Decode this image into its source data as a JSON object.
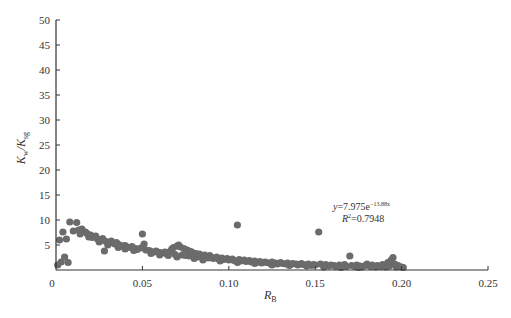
{
  "chart_data": {
    "type": "scatter",
    "title": "",
    "xlabel": "R_B",
    "xlabel_main": "R",
    "xlabel_sub": "B",
    "ylabel": "K_w/K_sg",
    "ylabel_main1": "K",
    "ylabel_sub1": "w",
    "ylabel_sep": "/K",
    "ylabel_sub2": "sg",
    "xlim": [
      0,
      0.25
    ],
    "ylim": [
      0,
      50
    ],
    "xticks": [
      0,
      0.05,
      0.1,
      0.15,
      0.2,
      0.25
    ],
    "xtick_labels": [
      "0",
      "0.05",
      "0.10",
      "0.15",
      "0.20",
      "0.25"
    ],
    "yticks": [
      5,
      10,
      15,
      20,
      25,
      30,
      35,
      40,
      45,
      50
    ],
    "ytick_labels": [
      "5",
      "10",
      "15",
      "20",
      "25",
      "30",
      "35",
      "40",
      "45",
      "50"
    ],
    "grid": false,
    "legend": null,
    "marker_color": "#6b6b6b",
    "annotation": {
      "equation_prefix": "y=7.975e",
      "equation_exponent": "−13.88x",
      "r2_prefix": "R",
      "r2_sup": "2",
      "r2_value": "=0.7948",
      "x": 0.152,
      "y": 12.2
    },
    "fit": {
      "type": "exponential",
      "a": 7.975,
      "b": -13.88,
      "r2": 0.7948
    },
    "points": [
      [
        0.001,
        1.0
      ],
      [
        0.003,
        1.6
      ],
      [
        0.005,
        2.6
      ],
      [
        0.007,
        1.5
      ],
      [
        0.002,
        6.0
      ],
      [
        0.004,
        7.6
      ],
      [
        0.006,
        6.2
      ],
      [
        0.008,
        9.6
      ],
      [
        0.012,
        9.5
      ],
      [
        0.01,
        7.8
      ],
      [
        0.013,
        8.0
      ],
      [
        0.015,
        8.2
      ],
      [
        0.017,
        7.6
      ],
      [
        0.018,
        7.3
      ],
      [
        0.02,
        7.0
      ],
      [
        0.021,
        6.5
      ],
      [
        0.023,
        6.8
      ],
      [
        0.024,
        6.2
      ],
      [
        0.026,
        5.9
      ],
      [
        0.027,
        6.3
      ],
      [
        0.028,
        3.8
      ],
      [
        0.029,
        5.7
      ],
      [
        0.031,
        5.4
      ],
      [
        0.032,
        5.8
      ],
      [
        0.034,
        5.2
      ],
      [
        0.035,
        5.5
      ],
      [
        0.037,
        5.0
      ],
      [
        0.038,
        4.8
      ],
      [
        0.04,
        4.9
      ],
      [
        0.041,
        4.6
      ],
      [
        0.043,
        4.5
      ],
      [
        0.044,
        4.7
      ],
      [
        0.046,
        4.3
      ],
      [
        0.047,
        4.1
      ],
      [
        0.049,
        4.4
      ],
      [
        0.05,
        7.2
      ],
      [
        0.051,
        5.2
      ],
      [
        0.052,
        4.0
      ],
      [
        0.054,
        3.9
      ],
      [
        0.055,
        3.7
      ],
      [
        0.057,
        3.6
      ],
      [
        0.058,
        3.8
      ],
      [
        0.06,
        3.5
      ],
      [
        0.061,
        3.4
      ],
      [
        0.063,
        3.6
      ],
      [
        0.064,
        3.2
      ],
      [
        0.066,
        3.7
      ],
      [
        0.067,
        4.2
      ],
      [
        0.068,
        4.5
      ],
      [
        0.069,
        3.1
      ],
      [
        0.07,
        4.8
      ],
      [
        0.071,
        5.0
      ],
      [
        0.072,
        4.6
      ],
      [
        0.073,
        3.0
      ],
      [
        0.074,
        4.3
      ],
      [
        0.075,
        2.9
      ],
      [
        0.076,
        4.0
      ],
      [
        0.077,
        2.8
      ],
      [
        0.078,
        3.7
      ],
      [
        0.079,
        3.5
      ],
      [
        0.08,
        2.7
      ],
      [
        0.081,
        3.3
      ],
      [
        0.082,
        2.6
      ],
      [
        0.083,
        3.2
      ],
      [
        0.084,
        2.8
      ],
      [
        0.085,
        2.5
      ],
      [
        0.086,
        3.0
      ],
      [
        0.087,
        2.6
      ],
      [
        0.088,
        2.4
      ],
      [
        0.089,
        2.9
      ],
      [
        0.09,
        2.5
      ],
      [
        0.091,
        2.3
      ],
      [
        0.093,
        2.6
      ],
      [
        0.094,
        2.2
      ],
      [
        0.096,
        2.4
      ],
      [
        0.097,
        2.1
      ],
      [
        0.099,
        2.3
      ],
      [
        0.1,
        2.0
      ],
      [
        0.102,
        2.2
      ],
      [
        0.103,
        1.9
      ],
      [
        0.105,
        9.0
      ],
      [
        0.106,
        2.1
      ],
      [
        0.107,
        1.8
      ],
      [
        0.109,
        2.0
      ],
      [
        0.11,
        1.7
      ],
      [
        0.112,
        1.9
      ],
      [
        0.113,
        1.6
      ],
      [
        0.115,
        1.8
      ],
      [
        0.116,
        1.5
      ],
      [
        0.118,
        1.7
      ],
      [
        0.119,
        1.4
      ],
      [
        0.121,
        1.6
      ],
      [
        0.122,
        1.5
      ],
      [
        0.124,
        1.3
      ],
      [
        0.125,
        1.6
      ],
      [
        0.127,
        1.4
      ],
      [
        0.128,
        1.2
      ],
      [
        0.13,
        1.5
      ],
      [
        0.131,
        1.3
      ],
      [
        0.133,
        1.2
      ],
      [
        0.134,
        1.4
      ],
      [
        0.136,
        1.1
      ],
      [
        0.137,
        1.3
      ],
      [
        0.139,
        1.2
      ],
      [
        0.14,
        1.0
      ],
      [
        0.142,
        1.3
      ],
      [
        0.143,
        1.1
      ],
      [
        0.145,
        1.0
      ],
      [
        0.146,
        1.2
      ],
      [
        0.148,
        0.9
      ],
      [
        0.149,
        1.1
      ],
      [
        0.15,
        1.0
      ],
      [
        0.152,
        7.6
      ],
      [
        0.153,
        1.2
      ],
      [
        0.155,
        0.9
      ],
      [
        0.156,
        1.1
      ],
      [
        0.158,
        0.8
      ],
      [
        0.159,
        1.0
      ],
      [
        0.161,
        0.9
      ],
      [
        0.162,
        0.7
      ],
      [
        0.164,
        1.0
      ],
      [
        0.165,
        0.8
      ],
      [
        0.167,
        1.1
      ],
      [
        0.168,
        0.7
      ],
      [
        0.17,
        2.8
      ],
      [
        0.171,
        0.9
      ],
      [
        0.173,
        0.7
      ],
      [
        0.174,
        1.0
      ],
      [
        0.176,
        0.8
      ],
      [
        0.177,
        0.6
      ],
      [
        0.179,
        0.9
      ],
      [
        0.18,
        1.2
      ],
      [
        0.182,
        0.7
      ],
      [
        0.183,
        1.0
      ],
      [
        0.185,
        0.6
      ],
      [
        0.186,
        0.9
      ],
      [
        0.188,
        0.7
      ],
      [
        0.189,
        1.1
      ],
      [
        0.191,
        0.6
      ],
      [
        0.192,
        1.5
      ],
      [
        0.193,
        0.8
      ],
      [
        0.194,
        2.0
      ],
      [
        0.195,
        2.5
      ],
      [
        0.196,
        1.2
      ],
      [
        0.197,
        0.6
      ],
      [
        0.198,
        0.9
      ],
      [
        0.2,
        0.6
      ],
      [
        0.201,
        0.5
      ],
      [
        0.085,
        2.0
      ],
      [
        0.095,
        1.8
      ],
      [
        0.105,
        1.5
      ],
      [
        0.115,
        1.3
      ],
      [
        0.125,
        1.0
      ],
      [
        0.135,
        0.9
      ],
      [
        0.145,
        0.8
      ],
      [
        0.155,
        0.6
      ],
      [
        0.165,
        0.5
      ],
      [
        0.175,
        0.5
      ],
      [
        0.06,
        3.0
      ],
      [
        0.07,
        2.6
      ],
      [
        0.08,
        2.3
      ],
      [
        0.04,
        4.2
      ],
      [
        0.045,
        3.9
      ],
      [
        0.055,
        3.3
      ],
      [
        0.065,
        2.9
      ],
      [
        0.03,
        5.0
      ],
      [
        0.036,
        4.5
      ],
      [
        0.014,
        7.2
      ],
      [
        0.019,
        6.6
      ],
      [
        0.025,
        5.6
      ]
    ]
  }
}
